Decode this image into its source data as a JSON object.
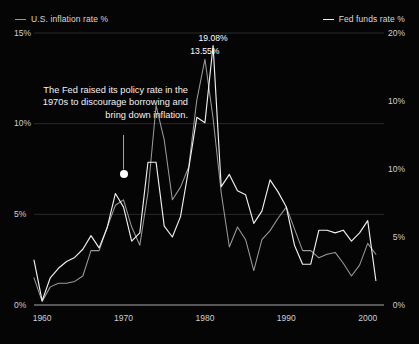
{
  "legend": {
    "inflation": {
      "label": "U.S. inflation rate %",
      "color": "#9a9a9a"
    },
    "fedfunds": {
      "label": "Fed funds rate %",
      "color": "#f0f0f0"
    }
  },
  "axes": {
    "left": {
      "ticks": [
        "15%",
        "10%",
        "5%",
        "0%"
      ],
      "values": [
        15,
        10,
        5,
        0
      ],
      "min": 0,
      "max": 15
    },
    "right": {
      "ticks": [
        "20%",
        "10%",
        "10%",
        "5%",
        "0%"
      ],
      "values": [
        20,
        15,
        10,
        5,
        0
      ],
      "min": 0,
      "max": 20
    },
    "x": {
      "ticks": [
        "1960",
        "1970",
        "1980",
        "1990",
        "2000"
      ],
      "values": [
        1960,
        1970,
        1980,
        1990,
        2000
      ],
      "min": 1959,
      "max": 2002
    }
  },
  "annotation": {
    "text": "The Fed raised its policy rate in the 1970s to discourage borrowing and bring down inflation.",
    "marker_year": 1970,
    "marker_value": 7.2
  },
  "point_labels": [
    {
      "text": "19.08%",
      "x": 1981,
      "y": 19.08,
      "series": "fedfunds"
    },
    {
      "text": "13.55%",
      "x": 1980,
      "y": 13.55,
      "series": "inflation"
    }
  ],
  "chart_data": {
    "type": "line",
    "title": "",
    "subtitle": "",
    "xlabel": "",
    "ylabel": "",
    "grid": true,
    "legend_position": "top",
    "xlim": [
      1959,
      2002
    ],
    "ylim_left": [
      0,
      15
    ],
    "ylim_right": [
      0,
      20
    ],
    "x": [
      1959,
      1960,
      1961,
      1962,
      1963,
      1964,
      1965,
      1966,
      1967,
      1968,
      1969,
      1970,
      1971,
      1972,
      1973,
      1974,
      1975,
      1976,
      1977,
      1978,
      1979,
      1980,
      1981,
      1982,
      1983,
      1984,
      1985,
      1986,
      1987,
      1988,
      1989,
      1990,
      1991,
      1992,
      1993,
      1994,
      1995,
      1996,
      1997,
      1998,
      1999,
      2000,
      2001
    ],
    "series": [
      {
        "name": "U.S. inflation rate %",
        "axis": "left",
        "color": "#9a9a9a",
        "values": [
          1.5,
          0.2,
          1.0,
          1.2,
          1.2,
          1.3,
          1.6,
          3.0,
          3.0,
          4.3,
          5.5,
          5.8,
          4.3,
          3.3,
          6.2,
          11.0,
          9.1,
          5.8,
          6.5,
          7.6,
          11.3,
          13.55,
          10.3,
          6.2,
          3.2,
          4.3,
          3.6,
          1.9,
          3.6,
          4.1,
          4.8,
          5.4,
          4.2,
          3.0,
          3.0,
          2.6,
          2.8,
          2.9,
          2.3,
          1.6,
          2.2,
          3.4,
          2.8
        ]
      },
      {
        "name": "Fed funds rate %",
        "axis": "right",
        "color": "#f0f0f0",
        "values": [
          3.3,
          0.3,
          2.0,
          2.7,
          3.2,
          3.5,
          4.1,
          5.1,
          4.2,
          5.7,
          8.2,
          7.2,
          4.7,
          5.3,
          10.5,
          10.5,
          5.8,
          5.0,
          6.5,
          10.0,
          13.8,
          13.4,
          19.08,
          8.7,
          9.6,
          8.4,
          8.1,
          6.0,
          6.9,
          9.2,
          8.3,
          7.2,
          4.4,
          3.0,
          3.0,
          5.5,
          5.5,
          5.3,
          5.5,
          4.7,
          5.3,
          6.2,
          1.8
        ]
      }
    ]
  }
}
